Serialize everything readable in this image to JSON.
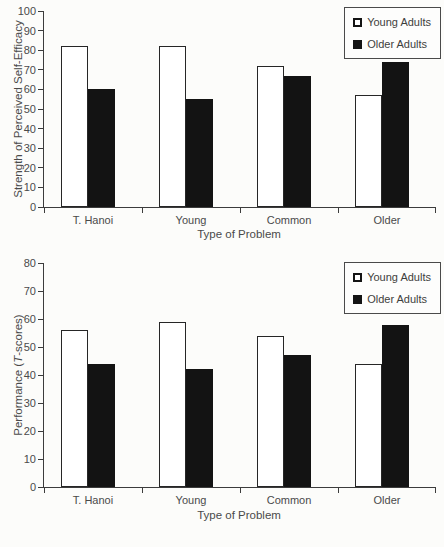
{
  "figure": {
    "background": "#fcfcfa",
    "text_color": "#4a4a4a",
    "bar_outline_color": "#262626",
    "bar_dark_fill": "#131313",
    "bar_light_fill": "#ffffff"
  },
  "chart_data": [
    {
      "type": "bar",
      "title": "",
      "categories": [
        "T. Hanoi",
        "Young",
        "Common",
        "Older"
      ],
      "series": [
        {
          "name": "Young Adults",
          "style": "open-white",
          "values": [
            82,
            82,
            72,
            57
          ]
        },
        {
          "name": "Older Adults",
          "style": "solid-black",
          "values": [
            60,
            55,
            67,
            74
          ]
        }
      ],
      "xlabel": "Type of Problem",
      "ylabel": "Strength of Perceived Self-Efficacy",
      "ylabel_parts": {
        "prefix": "Strength of Perceived Self-Efficacy",
        "italic": "",
        "suffix": ""
      },
      "ylim": [
        0,
        100
      ],
      "ytick_step": 10,
      "grid": false,
      "legend_position": "top-right"
    },
    {
      "type": "bar",
      "title": "",
      "categories": [
        "T. Hanoi",
        "Young",
        "Common",
        "Older"
      ],
      "series": [
        {
          "name": "Young Adults",
          "style": "open-white",
          "values": [
            56,
            59,
            54,
            44
          ]
        },
        {
          "name": "Older Adults",
          "style": "solid-black",
          "values": [
            44,
            42,
            47,
            58
          ]
        }
      ],
      "xlabel": "Type of Problem",
      "ylabel": "Performance (T-scores)",
      "ylabel_parts": {
        "prefix": "Performance (",
        "italic": "T",
        "suffix": "-scores)"
      },
      "ylim": [
        0,
        80
      ],
      "ytick_step": 10,
      "grid": false,
      "legend_position": "top-right"
    }
  ]
}
